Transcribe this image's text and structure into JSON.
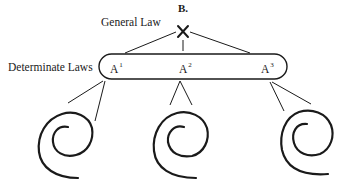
{
  "diagram": {
    "section_label": "B.",
    "general_law": {
      "label": "General Law",
      "symbol": "X"
    },
    "determinate_laws": {
      "label": "Determinate Laws",
      "nodes": [
        {
          "base": "A",
          "sup": "1"
        },
        {
          "base": "A",
          "sup": "2"
        },
        {
          "base": "A",
          "sup": "3"
        }
      ]
    },
    "instances": [
      {
        "icon": "spiral-icon"
      },
      {
        "icon": "spiral-icon"
      },
      {
        "icon": "spiral-icon"
      }
    ],
    "colors": {
      "ink": "#1a1a1a",
      "background": "#ffffff"
    }
  }
}
